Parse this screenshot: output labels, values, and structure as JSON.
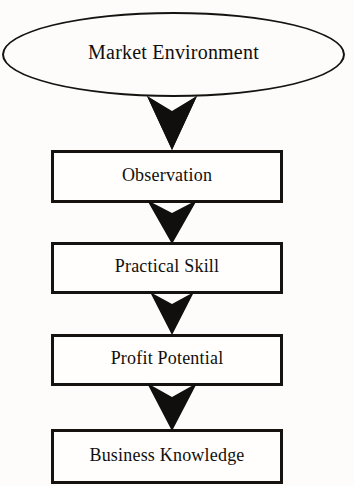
{
  "diagram": {
    "type": "flowchart",
    "orientation": "vertical-top-down",
    "background_color": "#fdfcfa",
    "line_color": "#15120f",
    "fill_color": "#ffffff",
    "nodes": [
      {
        "id": "market-environment",
        "shape": "ellipse",
        "label": "Market Environment"
      },
      {
        "id": "observation",
        "shape": "rectangle",
        "label": "Observation"
      },
      {
        "id": "practical-skill",
        "shape": "rectangle",
        "label": "Practical Skill"
      },
      {
        "id": "profit-potential",
        "shape": "rectangle",
        "label": "Profit Potential"
      },
      {
        "id": "business-knowledge",
        "shape": "rectangle",
        "label": "Business Knowledge"
      }
    ],
    "connectors": [
      {
        "id": "arrow-1",
        "from": "market-environment",
        "to": "observation",
        "style": "solid-chevron-down"
      },
      {
        "id": "arrow-2",
        "from": "observation",
        "to": "practical-skill",
        "style": "solid-chevron-down"
      },
      {
        "id": "arrow-3",
        "from": "practical-skill",
        "to": "profit-potential",
        "style": "solid-chevron-down"
      },
      {
        "id": "arrow-4",
        "from": "profit-potential",
        "to": "business-knowledge",
        "style": "solid-chevron-down"
      }
    ]
  }
}
